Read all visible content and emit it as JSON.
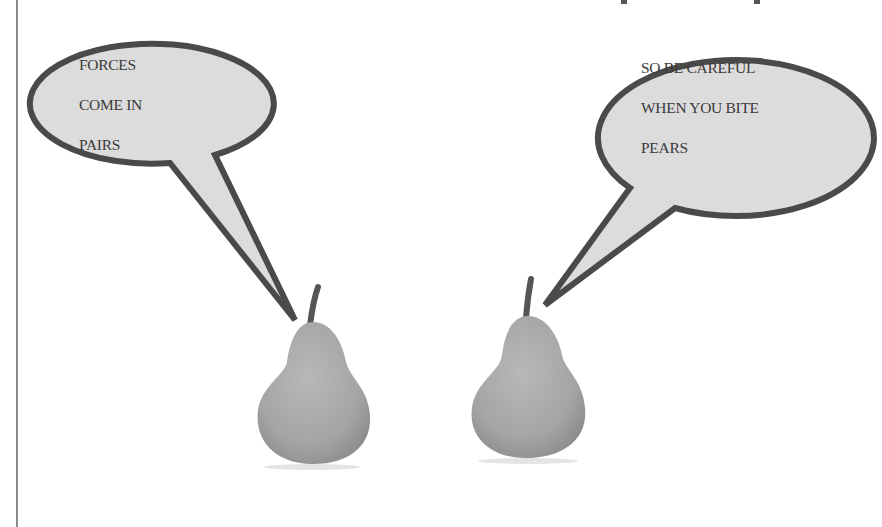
{
  "scene": {
    "description": "Two pears with speech bubbles (physics joke)",
    "colors": {
      "background": "#ffffff",
      "bubble_fill": "#dcdcdc",
      "bubble_stroke": "#4a4a4a",
      "text": "#3a3a3a",
      "pear_fill": "#a9a9a9",
      "pear_stem": "#555555",
      "margin_line": "#8a8a8a"
    }
  },
  "bubbles": [
    {
      "id": "left",
      "lines": [
        "FORCES",
        "COME IN",
        "PAIRS"
      ]
    },
    {
      "id": "right",
      "lines": [
        "SO BE CAREFUL",
        "WHEN YOU BITE",
        "PEARS"
      ]
    }
  ],
  "pears": [
    {
      "id": "left-pear",
      "label": "pear"
    },
    {
      "id": "right-pear",
      "label": "pear"
    }
  ]
}
